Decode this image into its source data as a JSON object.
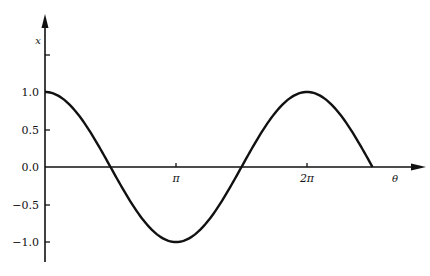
{
  "chart_data": {
    "type": "line",
    "title": "",
    "xlabel": "θ",
    "ylabel": "x",
    "x_ticks": [
      {
        "label": "π",
        "value": 3.14159
      },
      {
        "label": "2π",
        "value": 6.28319
      }
    ],
    "y_ticks": [
      {
        "label": "1.0",
        "value": 1.0
      },
      {
        "label": "0.5",
        "value": 0.5
      },
      {
        "label": "0.0",
        "value": 0.0
      },
      {
        "label": "-0.5",
        "value": -0.5
      },
      {
        "label": "-1.0",
        "value": -1.0
      }
    ],
    "xlim": [
      0,
      2.9
    ],
    "ylim": [
      -1.25,
      1.5
    ],
    "x_units": "multiples of pi",
    "grid": false,
    "legend": null,
    "series": [
      {
        "name": "x = cos θ",
        "x": [
          0,
          0.125,
          0.25,
          0.375,
          0.5,
          0.625,
          0.75,
          0.875,
          1.0,
          1.125,
          1.25,
          1.375,
          1.5,
          1.625,
          1.75,
          1.875,
          2.0,
          2.125,
          2.25,
          2.375,
          2.5
        ],
        "values": [
          1.0,
          0.924,
          0.707,
          0.383,
          0.0,
          -0.383,
          -0.707,
          -0.924,
          -1.0,
          -0.924,
          -0.707,
          -0.383,
          0.0,
          0.383,
          0.707,
          0.924,
          1.0,
          0.924,
          0.707,
          0.383,
          0.0
        ]
      }
    ]
  },
  "labels": {
    "y_axis": "x",
    "x_axis": "θ",
    "pi": "π",
    "two_pi": "2π",
    "y1": "1.0",
    "y05": "0.5",
    "y0": "0.0",
    "ym05": "−0.5",
    "ym1": "−1.0"
  }
}
